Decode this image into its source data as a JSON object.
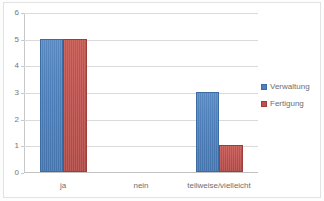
{
  "chart_data": {
    "type": "bar",
    "title": "",
    "xlabel": "",
    "ylabel": "",
    "categories": [
      "ja",
      "nein",
      "teilweise/vielleicht"
    ],
    "series": [
      {
        "name": "Verwaltung",
        "color": "#4F81BD",
        "values": [
          5,
          0,
          3
        ]
      },
      {
        "name": "Fertigung",
        "color": "#C0504D",
        "values": [
          5,
          0,
          1
        ]
      }
    ],
    "ylim": [
      0,
      6
    ],
    "yticks": [
      0,
      1,
      2,
      3,
      4,
      5,
      6
    ],
    "ytick_labels": [
      "0",
      "1",
      "2",
      "3",
      "4",
      "5",
      "6"
    ],
    "grid": true,
    "grid_axis": "y",
    "legend_position": "right"
  },
  "legend": {
    "entries": [
      {
        "label": "Verwaltung"
      },
      {
        "label": "Fertigung"
      }
    ]
  },
  "colors": {
    "series_verwaltung": "#4F81BD",
    "series_fertigung": "#C0504D",
    "gridline": "#DADADA",
    "axis": "#C2C2C2",
    "text": "#6E6E6E",
    "background": "#FFFFFF"
  }
}
